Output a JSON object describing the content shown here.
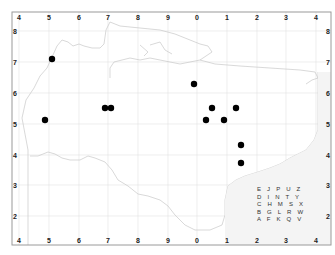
{
  "map": {
    "title": "",
    "x_ticks_top": [
      "4",
      "5",
      "6",
      "7",
      "8",
      "9",
      "0",
      "1",
      "2",
      "3",
      "4"
    ],
    "x_ticks_bottom": [
      "4",
      "5",
      "6",
      "7",
      "8",
      "9",
      "0",
      "1",
      "2",
      "3",
      "4"
    ],
    "y_ticks_left": [
      "8",
      "7",
      "6",
      "5",
      "4",
      "3",
      "2"
    ],
    "y_ticks_right": [
      "8",
      "7",
      "6",
      "5",
      "4",
      "3",
      "2"
    ],
    "colors": {
      "frame": "#999999",
      "grid": "#dddddd",
      "coast": "#cccccc",
      "dot": "#000000"
    },
    "points": [
      {
        "x": 52,
        "y": 59
      },
      {
        "x": 45,
        "y": 120
      },
      {
        "x": 105,
        "y": 108
      },
      {
        "x": 111,
        "y": 108
      },
      {
        "x": 194,
        "y": 84
      },
      {
        "x": 212,
        "y": 108
      },
      {
        "x": 236,
        "y": 108
      },
      {
        "x": 206,
        "y": 120
      },
      {
        "x": 224,
        "y": 120
      },
      {
        "x": 241,
        "y": 145
      },
      {
        "x": 241,
        "y": 163
      }
    ],
    "letter_grid": [
      [
        "E",
        "J",
        "P",
        "U",
        "Z"
      ],
      [
        "D",
        "I",
        "N",
        "T",
        "Y"
      ],
      [
        "C",
        "H",
        "M",
        "S",
        "X"
      ],
      [
        "B",
        "G",
        "L",
        "R",
        "W"
      ],
      [
        "A",
        "F",
        "K",
        "Q",
        "V"
      ]
    ]
  }
}
